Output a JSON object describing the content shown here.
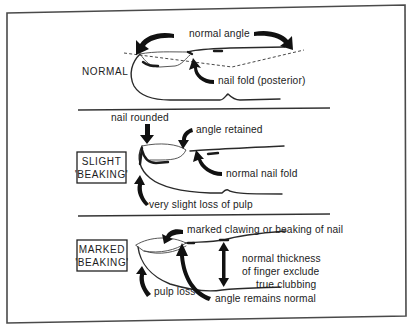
{
  "diagram": {
    "panels": [
      {
        "id": "normal",
        "caption": "NORMAL",
        "boxed": false,
        "annotations": {
          "top": "normal angle",
          "nail_fold": "nail fold (posterior)"
        }
      },
      {
        "id": "slight",
        "caption_line1": "SLIGHT",
        "caption_line2": "'BEAKING'",
        "boxed": true,
        "annotations": {
          "nail_rounded": "nail rounded",
          "angle_retained": "angle retained",
          "normal_nail_fold": "normal nail fold",
          "pulp": "very slight loss of pulp"
        }
      },
      {
        "id": "marked",
        "caption_line1": "MARKED",
        "caption_line2": "'BEAKING'",
        "boxed": true,
        "annotations": {
          "clawing": "marked clawing or beaking of nail",
          "thickness_line1": "normal thickness",
          "thickness_line2": "of finger exclude",
          "thickness_line3": "true clubbing",
          "pulp_loss": "pulp loss",
          "angle_normal": "angle remains normal"
        }
      }
    ],
    "colors": {
      "background": "#ffffff",
      "ink": "#1c1c1c",
      "frame": "#4a4a4a"
    }
  }
}
